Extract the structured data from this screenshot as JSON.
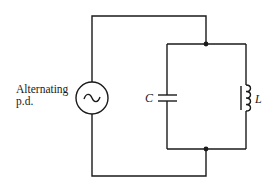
{
  "diagram": {
    "type": "circuit",
    "source": {
      "label_line1": "Alternating",
      "label_line2": "p.d.",
      "symbol": "ac-source-icon"
    },
    "components": {
      "capacitor": {
        "label": "C"
      },
      "inductor": {
        "label": "L"
      }
    },
    "junctions": [
      "top-junction",
      "bottom-junction"
    ],
    "colors": {
      "line": "#1a1a1a",
      "background": "#ffffff"
    }
  }
}
